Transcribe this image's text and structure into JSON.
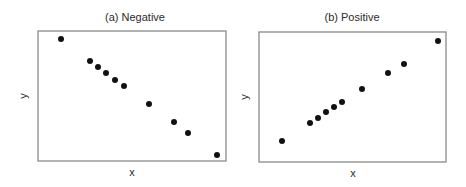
{
  "chart_data": [
    {
      "type": "scatter",
      "title": "(a) Negative",
      "xlabel": "x",
      "ylabel": "y",
      "grid": false,
      "ticks": false,
      "frame_px": {
        "left": 38,
        "top": 31,
        "right": 226,
        "bottom": 161
      },
      "points_px": [
        [
          61,
          39
        ],
        [
          90,
          61
        ],
        [
          98,
          67
        ],
        [
          106,
          73
        ],
        [
          115,
          80
        ],
        [
          124,
          86
        ],
        [
          149,
          104
        ],
        [
          174,
          122
        ],
        [
          188,
          133
        ],
        [
          217,
          155
        ]
      ],
      "points_normalized": [
        {
          "x": 0.12,
          "y": 0.94
        },
        {
          "x": 0.28,
          "y": 0.77
        },
        {
          "x": 0.32,
          "y": 0.72
        },
        {
          "x": 0.36,
          "y": 0.68
        },
        {
          "x": 0.41,
          "y": 0.62
        },
        {
          "x": 0.46,
          "y": 0.58
        },
        {
          "x": 0.59,
          "y": 0.44
        },
        {
          "x": 0.72,
          "y": 0.3
        },
        {
          "x": 0.8,
          "y": 0.22
        },
        {
          "x": 0.95,
          "y": 0.05
        }
      ]
    },
    {
      "type": "scatter",
      "title": "(b) Positive",
      "xlabel": "x",
      "ylabel": "y",
      "grid": false,
      "ticks": false,
      "frame_px": {
        "left": 259,
        "top": 32,
        "right": 446,
        "bottom": 162
      },
      "points_px": [
        [
          282,
          141
        ],
        [
          310,
          123
        ],
        [
          318,
          118
        ],
        [
          326,
          112
        ],
        [
          334,
          107
        ],
        [
          342,
          102
        ],
        [
          362,
          89
        ],
        [
          388,
          73
        ],
        [
          404,
          64
        ],
        [
          438,
          41
        ]
      ],
      "points_normalized": [
        {
          "x": 0.12,
          "y": 0.16
        },
        {
          "x": 0.27,
          "y": 0.3
        },
        {
          "x": 0.32,
          "y": 0.34
        },
        {
          "x": 0.36,
          "y": 0.38
        },
        {
          "x": 0.4,
          "y": 0.42
        },
        {
          "x": 0.45,
          "y": 0.46
        },
        {
          "x": 0.55,
          "y": 0.56
        },
        {
          "x": 0.69,
          "y": 0.68
        },
        {
          "x": 0.78,
          "y": 0.75
        },
        {
          "x": 0.96,
          "y": 0.93
        }
      ]
    }
  ],
  "style": {
    "dot_color": "#111111",
    "frame_color": "#8a8a8a",
    "text_color": "#2a2a2a",
    "dot_radius": 3
  }
}
